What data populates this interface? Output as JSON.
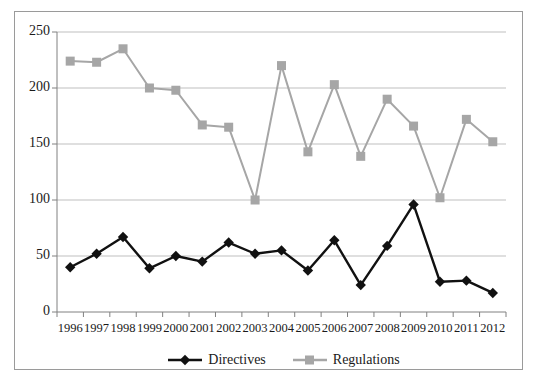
{
  "chart_data": {
    "type": "line",
    "title": "",
    "subtitle": "",
    "xlabel": "",
    "ylabel": "",
    "categories": [
      "1996",
      "1997",
      "1998",
      "1999",
      "2000",
      "2001",
      "2002",
      "2003",
      "2004",
      "2005",
      "2006",
      "2007",
      "2008",
      "2009",
      "2010",
      "2011",
      "2012"
    ],
    "series": [
      {
        "name": "Directives",
        "color": "#111111",
        "marker": "diamond",
        "values": [
          40,
          52,
          67,
          39,
          50,
          45,
          62,
          52,
          55,
          37,
          64,
          24,
          59,
          96,
          27,
          28,
          17
        ]
      },
      {
        "name": "Regulations",
        "color": "#a6a6a6",
        "marker": "square",
        "values": [
          224,
          223,
          235,
          200,
          198,
          167,
          165,
          100,
          220,
          143,
          203,
          139,
          190,
          166,
          102,
          172,
          152
        ]
      }
    ],
    "ylim": [
      0,
      250
    ],
    "yticks": [
      0,
      50,
      100,
      150,
      200,
      250
    ],
    "ytick_labels": [
      "0",
      "50",
      "100",
      "150",
      "200",
      "250"
    ],
    "grid": "horizontal",
    "legend_position": "bottom",
    "legend": [
      "Directives",
      "Regulations"
    ]
  },
  "style": {
    "frame_color": "#9a9a9a",
    "grid_color": "#bfbfbf",
    "axis_color": "#808080",
    "plot_background": "#ffffff",
    "text_color": "#1a1a1a"
  }
}
